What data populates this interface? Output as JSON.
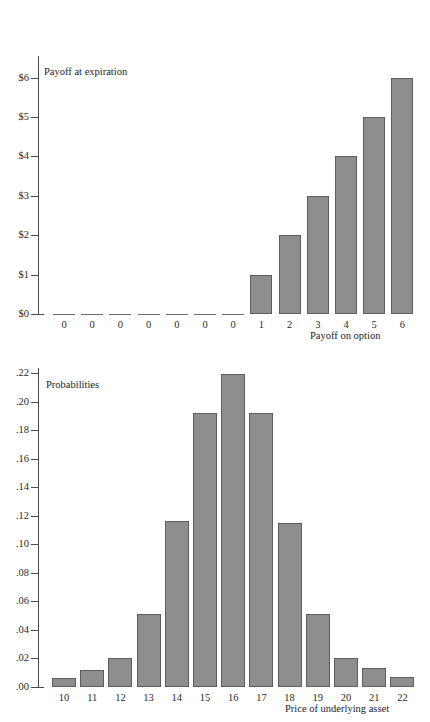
{
  "chart_data": [
    {
      "id": "payoff",
      "type": "bar",
      "title": "",
      "series_label": "Payoff at expiration",
      "xlabel": "Payoff on option",
      "ylabel": "",
      "categories": [
        "0",
        "0",
        "0",
        "0",
        "0",
        "0",
        "0",
        "1",
        "2",
        "3",
        "4",
        "5",
        "6"
      ],
      "values": [
        0,
        0,
        0,
        0,
        0,
        0,
        0,
        1,
        2,
        3,
        4,
        5,
        6
      ],
      "ytick_labels": [
        "$0",
        "$1",
        "$2",
        "$3",
        "$4",
        "$5",
        "$6"
      ],
      "ytick_values": [
        0,
        1,
        2,
        3,
        4,
        5,
        6
      ],
      "ylim": [
        0,
        6.55
      ],
      "grid": false,
      "legend": "none",
      "bar_color": "#8e8e8e",
      "bar_border_color": "#5d5d5d",
      "axis_color": "#4a4a4a"
    },
    {
      "id": "probabilities",
      "type": "bar",
      "title": "",
      "series_label": "Probabilities",
      "xlabel": "Price of underlying asset",
      "ylabel": "",
      "categories": [
        "10",
        "11",
        "12",
        "13",
        "14",
        "15",
        "16",
        "17",
        "18",
        "19",
        "20",
        "21",
        "22"
      ],
      "values": [
        0.006,
        0.012,
        0.02,
        0.051,
        0.116,
        0.192,
        0.219,
        0.192,
        0.115,
        0.051,
        0.02,
        0.013,
        0.007
      ],
      "ytick_labels": [
        ".00",
        ".02",
        ".04",
        ".06",
        ".08",
        ".10",
        ".12",
        ".14",
        ".16",
        ".18",
        ".20",
        ".22"
      ],
      "ytick_values": [
        0.0,
        0.02,
        0.04,
        0.06,
        0.08,
        0.1,
        0.12,
        0.14,
        0.16,
        0.18,
        0.2,
        0.22
      ],
      "ylim": [
        0,
        0.2235
      ],
      "grid": false,
      "legend": "none",
      "bar_color": "#8e8e8e",
      "bar_border_color": "#5d5d5d",
      "axis_color": "#4a4a4a"
    }
  ]
}
